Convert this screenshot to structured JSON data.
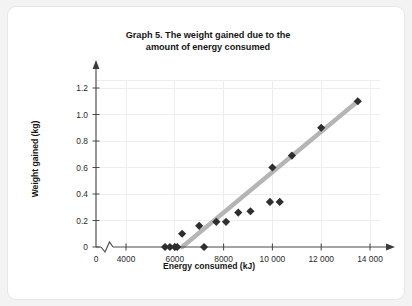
{
  "card": {
    "background_color": "#ffffff",
    "border_color": "#e6e7e9"
  },
  "page": {
    "background_color": "#f3f3f4"
  },
  "title": {
    "line1": "Graph 5. The weight gained due to the",
    "line2": "amount of energy consumed"
  },
  "chart_data": {
    "type": "scatter",
    "title": "Graph 5. The weight gained due to the amount of energy consumed",
    "xlabel": "Energy consumed (kJ)",
    "ylabel": "Weight gained (kg)",
    "xlim": [
      4000,
      14800
    ],
    "ylim": [
      0,
      1.28
    ],
    "xticks": [
      0,
      4000,
      6000,
      8000,
      10000,
      12000,
      14000
    ],
    "xtick_labels": [
      "0",
      "4000",
      "6000",
      "8000",
      "10 000",
      "12 000",
      "14 000"
    ],
    "yticks": [
      0,
      0.2,
      0.4,
      0.6,
      0.8,
      1.0,
      1.2
    ],
    "ytick_labels": [
      "0",
      "0.2",
      "0.4",
      "0.6",
      "0.8",
      "1.0",
      "1.2"
    ],
    "axis_break": {
      "axis": "x",
      "between": [
        0,
        4000
      ],
      "style": "zigzag"
    },
    "grid": true,
    "grid_color": "#eceded",
    "legend": null,
    "marker_shape": "diamond",
    "marker_color": "#2e2e2e",
    "points": [
      {
        "x": 5600,
        "y": 0.0
      },
      {
        "x": 5800,
        "y": 0.0
      },
      {
        "x": 6000,
        "y": 0.0
      },
      {
        "x": 6100,
        "y": 0.0
      },
      {
        "x": 7200,
        "y": 0.0
      },
      {
        "x": 6300,
        "y": 0.1
      },
      {
        "x": 7000,
        "y": 0.16
      },
      {
        "x": 7700,
        "y": 0.19
      },
      {
        "x": 8100,
        "y": 0.19
      },
      {
        "x": 8600,
        "y": 0.26
      },
      {
        "x": 9100,
        "y": 0.27
      },
      {
        "x": 9900,
        "y": 0.34
      },
      {
        "x": 10300,
        "y": 0.34
      },
      {
        "x": 10000,
        "y": 0.6
      },
      {
        "x": 10800,
        "y": 0.69
      },
      {
        "x": 12000,
        "y": 0.9
      },
      {
        "x": 13500,
        "y": 1.1
      }
    ],
    "trendline": {
      "color": "#b5b5b5",
      "start": {
        "x": 6300,
        "y": 0.0
      },
      "end": {
        "x": 13500,
        "y": 1.1
      }
    }
  }
}
